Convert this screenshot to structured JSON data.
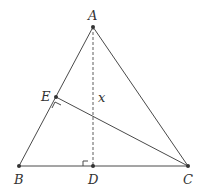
{
  "diagram": {
    "type": "geometry-triangle",
    "colors": {
      "stroke": "#4a4a4a",
      "point": "#333333",
      "label": "#333333",
      "background": "#ffffff"
    },
    "points": [
      {
        "name": "A",
        "x": 93,
        "y": 27,
        "label_x": 88,
        "label_y": 20
      },
      {
        "name": "B",
        "x": 19,
        "y": 166,
        "label_x": 14,
        "label_y": 184
      },
      {
        "name": "C",
        "x": 188,
        "y": 166,
        "label_x": 183,
        "label_y": 184
      },
      {
        "name": "D",
        "x": 93,
        "y": 166,
        "label_x": 88,
        "label_y": 184
      },
      {
        "name": "E",
        "x": 56,
        "y": 97,
        "label_x": 41,
        "label_y": 101
      }
    ],
    "segments": [
      {
        "from": "A",
        "to": "B",
        "style": "solid"
      },
      {
        "from": "A",
        "to": "C",
        "style": "solid"
      },
      {
        "from": "B",
        "to": "C",
        "style": "solid"
      },
      {
        "from": "E",
        "to": "C",
        "style": "solid"
      },
      {
        "from": "A",
        "to": "D",
        "style": "dashed"
      }
    ],
    "right_angles": [
      {
        "at": "D",
        "between": [
          "AD",
          "BD"
        ]
      },
      {
        "at": "E",
        "between": [
          "EC",
          "EB"
        ]
      }
    ],
    "annotations": [
      {
        "text": "x",
        "target": "AD",
        "x": 98,
        "y": 102
      }
    ]
  }
}
